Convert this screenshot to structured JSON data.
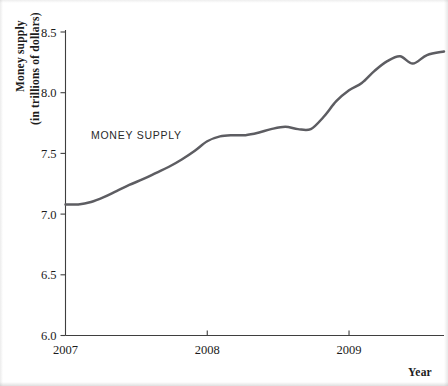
{
  "chart_data": {
    "type": "line",
    "title": "",
    "xlabel": "Year",
    "ylabel": "Money supply\n(in trillions of dollars)",
    "ylabel_line1": "Money supply",
    "ylabel_line2": "(in trillions of dollars)",
    "grid": false,
    "legend_position": "inline-annotation",
    "xlim": [
      2007.0,
      2009.67
    ],
    "ylim": [
      6.0,
      8.5
    ],
    "xticks": [
      2007,
      2008,
      2009
    ],
    "xtick_labels": [
      "2007",
      "2008",
      "2009"
    ],
    "yticks": [
      6.0,
      6.5,
      7.0,
      7.5,
      8.0,
      8.5
    ],
    "ytick_labels": [
      "6.0",
      "6.5",
      "7.0",
      "7.5",
      "8.0",
      "8.5"
    ],
    "annotations": [
      {
        "text": "MONEY SUPPLY",
        "x": 2007.5,
        "y": 7.62
      }
    ],
    "series": [
      {
        "name": "MONEY SUPPLY",
        "color": "#5d5d62",
        "x": [
          2007.0,
          2007.09,
          2007.18,
          2007.27,
          2007.36,
          2007.45,
          2007.55,
          2007.64,
          2007.73,
          2007.82,
          2007.91,
          2008.0,
          2008.09,
          2008.18,
          2008.27,
          2008.36,
          2008.45,
          2008.55,
          2008.64,
          2008.73,
          2008.82,
          2008.91,
          2009.0,
          2009.09,
          2009.18,
          2009.27,
          2009.36,
          2009.45,
          2009.55,
          2009.67
        ],
        "y": [
          7.08,
          7.08,
          7.1,
          7.14,
          7.19,
          7.24,
          7.29,
          7.34,
          7.39,
          7.45,
          7.52,
          7.6,
          7.64,
          7.65,
          7.65,
          7.67,
          7.7,
          7.72,
          7.7,
          7.7,
          7.8,
          7.93,
          8.02,
          8.08,
          8.18,
          8.26,
          8.3,
          8.24,
          8.31,
          8.34
        ]
      }
    ]
  },
  "axis": {
    "y_title_line1": "Money supply",
    "y_title_line2": "(in trillions of dollars)",
    "x_title": "Year"
  }
}
